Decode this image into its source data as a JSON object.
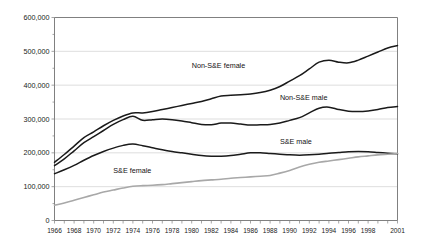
{
  "chart_data": {
    "type": "line",
    "title": "",
    "xlabel": "",
    "ylabel": "",
    "ylim": [
      0,
      600000
    ],
    "xlim": [
      1966,
      2001
    ],
    "grid": true,
    "legend_position": "inline-annotations",
    "ytick_labels": [
      "600,000",
      "500,000",
      "400,000",
      "300,000",
      "200,000",
      "100,000",
      "0"
    ],
    "ytick_values": [
      600000,
      500000,
      400000,
      300000,
      200000,
      100000,
      0
    ],
    "xtick_labels": [
      "1966",
      "1968",
      "1970",
      "1972",
      "1974",
      "1976",
      "1978",
      "1980",
      "1982",
      "1984",
      "1986",
      "1988",
      "1990",
      "1992",
      "1994",
      "1996",
      "1998",
      "2001"
    ],
    "x": [
      1966,
      1967,
      1968,
      1969,
      1970,
      1971,
      1972,
      1973,
      1974,
      1975,
      1976,
      1977,
      1978,
      1979,
      1980,
      1981,
      1982,
      1983,
      1984,
      1985,
      1986,
      1987,
      1988,
      1989,
      1990,
      1991,
      1992,
      1993,
      1994,
      1995,
      1996,
      1997,
      1998,
      1999,
      2000,
      2001
    ],
    "series": [
      {
        "name": "Non-S&E female",
        "color": "#1a1a1a",
        "label_x": 1980,
        "label_y": 450000,
        "values": [
          172000,
          195000,
          220000,
          245000,
          262000,
          280000,
          296000,
          309000,
          318000,
          318000,
          322000,
          328000,
          334000,
          340000,
          346000,
          352000,
          360000,
          368000,
          370000,
          372000,
          374000,
          378000,
          385000,
          396000,
          412000,
          428000,
          448000,
          468000,
          474000,
          468000,
          466000,
          474000,
          486000,
          498000,
          510000,
          517000
        ]
      },
      {
        "name": "Non-S&E male",
        "color": "#1a1a1a",
        "label_x": 1989,
        "label_y": 357000,
        "values": [
          162000,
          182000,
          206000,
          230000,
          248000,
          266000,
          284000,
          298000,
          308000,
          296000,
          298000,
          300000,
          298000,
          294000,
          289000,
          284000,
          283000,
          288000,
          288000,
          285000,
          282000,
          283000,
          284000,
          288000,
          296000,
          304000,
          318000,
          332000,
          335000,
          328000,
          323000,
          322000,
          324000,
          328000,
          334000,
          337000
        ]
      },
      {
        "name": "S&E male",
        "color": "#1a1a1a",
        "label_x": 1989,
        "label_y": 227000,
        "values": [
          138000,
          150000,
          163000,
          178000,
          192000,
          204000,
          214000,
          222000,
          226000,
          221000,
          215000,
          209000,
          204000,
          200000,
          196000,
          192000,
          190000,
          190000,
          192000,
          196000,
          200000,
          200000,
          198000,
          196000,
          194000,
          193000,
          194000,
          196000,
          199000,
          201000,
          203000,
          204000,
          203000,
          201000,
          199000,
          197000
        ]
      },
      {
        "name": "S&E female",
        "color": "#a8a8a8",
        "label_x": 1972,
        "label_y": 140000,
        "values": [
          45000,
          52000,
          60000,
          68000,
          76000,
          84000,
          90000,
          96000,
          101000,
          103000,
          104000,
          106000,
          109000,
          112000,
          115000,
          118000,
          120000,
          122000,
          125000,
          127000,
          129000,
          131000,
          133000,
          140000,
          148000,
          158000,
          166000,
          172000,
          176000,
          180000,
          184000,
          188000,
          191000,
          194000,
          196000,
          198000
        ]
      }
    ]
  }
}
